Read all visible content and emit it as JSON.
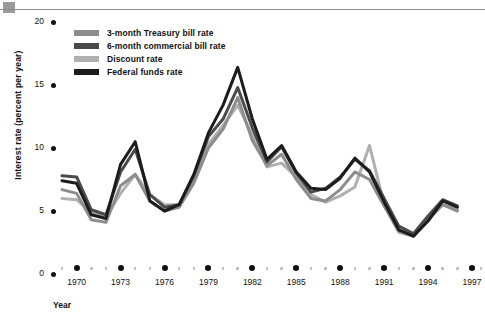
{
  "figure": {
    "top_rule": "horizontal-rule",
    "corner_square": "gray-square"
  },
  "axes": {
    "ylabel": "Interest rate (percent per year)",
    "xlabel": "Year",
    "yticks": [
      "0",
      "5",
      "10",
      "15",
      "20"
    ],
    "xticks": [
      "1970",
      "1973",
      "1976",
      "1979",
      "1982",
      "1985",
      "1988",
      "1991",
      "1994",
      "1997"
    ]
  },
  "legend": {
    "items": [
      {
        "label": "3-month Treasury bill rate",
        "color": "#8d8d8d"
      },
      {
        "label": "6-month commercial bill rate",
        "color": "#4a4a4a"
      },
      {
        "label": "Discount rate",
        "color": "#b0b0b0"
      },
      {
        "label": "Federal funds rate",
        "color": "#1c1c1c"
      }
    ]
  },
  "chart_data": {
    "type": "line",
    "title": "",
    "xlabel": "Year",
    "ylabel": "Interest rate (percent per year)",
    "xlim": [
      1969,
      1997
    ],
    "ylim": [
      0,
      20
    ],
    "grid": false,
    "legend_position": "top-left",
    "x": [
      1969,
      1970,
      1971,
      1972,
      1973,
      1974,
      1975,
      1976,
      1977,
      1978,
      1979,
      1980,
      1981,
      1982,
      1983,
      1984,
      1985,
      1986,
      1987,
      1988,
      1989,
      1990,
      1991,
      1992,
      1993,
      1994,
      1995,
      1996
    ],
    "series": [
      {
        "name": "3-month Treasury bill rate",
        "color": "#8d8d8d",
        "values": [
          6.7,
          6.4,
          4.3,
          4.1,
          7.0,
          7.9,
          5.8,
          5.0,
          5.3,
          7.2,
          10.0,
          11.5,
          14.0,
          10.6,
          8.6,
          9.5,
          7.5,
          6.0,
          5.8,
          6.7,
          8.1,
          7.5,
          5.4,
          3.4,
          3.0,
          4.3,
          5.5,
          5.0
        ]
      },
      {
        "name": "6-month commercial bill rate",
        "color": "#4a4a4a",
        "values": [
          7.8,
          7.7,
          5.1,
          4.7,
          8.1,
          9.9,
          6.3,
          5.3,
          5.5,
          7.8,
          10.9,
          12.3,
          14.8,
          11.6,
          8.9,
          10.1,
          8.0,
          6.5,
          6.8,
          7.7,
          9.1,
          8.2,
          6.0,
          3.8,
          3.2,
          4.6,
          5.9,
          5.4
        ]
      },
      {
        "name": "Discount rate",
        "color": "#b0b0b0",
        "values": [
          6.0,
          5.9,
          4.9,
          4.5,
          6.4,
          7.9,
          6.3,
          5.5,
          5.5,
          7.5,
          10.3,
          11.8,
          13.4,
          11.0,
          8.5,
          8.8,
          7.7,
          6.3,
          5.7,
          6.2,
          6.9,
          10.2,
          5.5,
          3.3,
          3.0,
          4.4,
          5.5,
          5.1
        ]
      },
      {
        "name": "Federal funds rate",
        "color": "#1c1c1c",
        "values": [
          7.4,
          7.2,
          4.7,
          4.4,
          8.7,
          10.5,
          5.8,
          5.0,
          5.5,
          7.9,
          11.2,
          13.4,
          16.4,
          12.3,
          9.1,
          10.2,
          8.1,
          6.8,
          6.7,
          7.6,
          9.2,
          8.1,
          5.7,
          3.5,
          3.0,
          4.2,
          5.8,
          5.3
        ]
      }
    ]
  }
}
